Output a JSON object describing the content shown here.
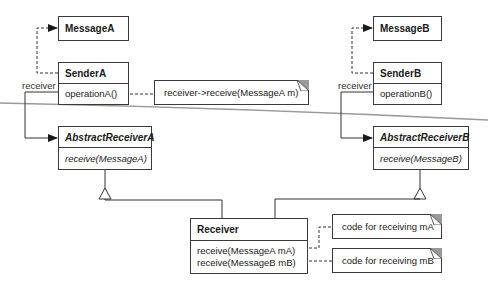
{
  "classes": {
    "message_a": {
      "name": "MessageA"
    },
    "sender_a": {
      "name": "SenderA",
      "operations": [
        "operationA()"
      ]
    },
    "message_b": {
      "name": "MessageB"
    },
    "sender_b": {
      "name": "SenderB",
      "operations": [
        "operationB()"
      ]
    },
    "abstract_receiver_a": {
      "name": "AbstractReceiverA",
      "operations": [
        "receive(MessageA)"
      ]
    },
    "abstract_receiver_b": {
      "name": "AbstractReceiverB",
      "operations": [
        "receive(MessageB)"
      ]
    },
    "receiver": {
      "name": "Receiver",
      "operations": [
        "receive(MessageA mA)",
        "receive(MessageB mB)"
      ]
    }
  },
  "notes": {
    "sender_a_note": "receiver->receive(MessageA m)",
    "receive_a_note": "code for receiving mA",
    "receive_b_note": "code for receiving mB"
  },
  "association_labels": {
    "sender_a_role": "receiver",
    "sender_b_role": "receiver"
  }
}
